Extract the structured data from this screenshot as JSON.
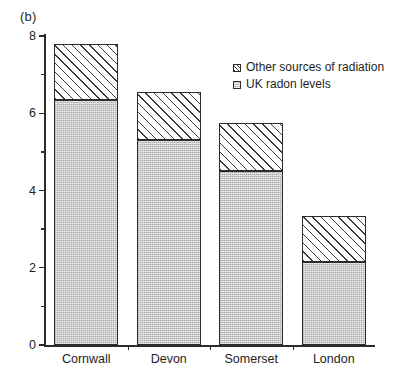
{
  "panel": {
    "label": "(b)"
  },
  "legend": {
    "items": [
      {
        "label": "Other sources of radiation",
        "swatch": "hatched-swatch-icon"
      },
      {
        "label": "UK radon levels",
        "swatch": "stippled-swatch-icon"
      }
    ]
  },
  "axes": {
    "y_ticks": [
      "0",
      "2",
      "4",
      "6",
      "8"
    ],
    "x_categories": [
      "Cornwall",
      "Devon",
      "Somerset",
      "London"
    ]
  },
  "chart_data": {
    "type": "bar",
    "title": "(b)",
    "xlabel": "",
    "ylabel": "",
    "ylim": [
      0,
      8
    ],
    "yticks": [
      0,
      2,
      4,
      6,
      8
    ],
    "minor_yticks": [
      1,
      3,
      5,
      7
    ],
    "grid": false,
    "stacked": true,
    "legend_position": "inside-top-right",
    "categories": [
      "Cornwall",
      "Devon",
      "Somerset",
      "London"
    ],
    "series": [
      {
        "name": "UK radon levels",
        "values": [
          6.35,
          5.3,
          4.5,
          2.15
        ]
      },
      {
        "name": "Other sources of radiation",
        "values": [
          1.45,
          1.25,
          1.25,
          1.2
        ]
      }
    ],
    "totals": [
      7.8,
      6.55,
      5.75,
      3.35
    ]
  }
}
